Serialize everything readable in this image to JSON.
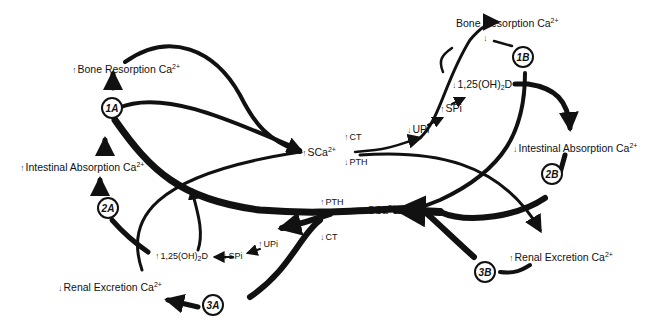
{
  "diagram": {
    "up": "↑",
    "down": "↓",
    "labels": {
      "left_bone_resorption": {
        "dir": "↑",
        "text": "Bone Resorption Ca",
        "sup": "2+"
      },
      "left_intestinal_absorption": {
        "dir": "↑",
        "text": "Intestinal Absorption Ca",
        "sup": "2+"
      },
      "left_renal_excretion": {
        "dir": "↓",
        "text": "Renal Excretion Ca",
        "sup": "2+"
      },
      "right_bone_resorption": {
        "text": "Bone Resorption Ca",
        "sup": "2+",
        "dir_below": "↓"
      },
      "right_intestinal_absorption": {
        "dir": "↓",
        "text": "Intestinal Absorption Ca",
        "sup": "2+"
      },
      "right_renal_excretion": {
        "dir": "↑",
        "text": "Renal Excretion Ca",
        "sup": "2+"
      },
      "upper_sca": {
        "dir": "↑",
        "text": "SCa",
        "sup": "2+"
      },
      "upper_ct": {
        "dir": "↑",
        "text": "CT"
      },
      "upper_pth": {
        "dir": "↓",
        "text": "PTH"
      },
      "upper_upi": {
        "dir": "↓",
        "text": "UPi"
      },
      "upper_spi": {
        "dir": "↑",
        "text": "SPi"
      },
      "upper_vitd": {
        "dir": "↓",
        "text_a": "1,25(OH)",
        "sub": "2",
        "text_b": "D"
      },
      "lower_sca": {
        "dir": "↓",
        "text": "SCa",
        "sup": "2+"
      },
      "lower_pth": {
        "dir": "↑",
        "text": "PTH"
      },
      "lower_ct": {
        "dir": "↓",
        "text": "CT"
      },
      "lower_upi": {
        "dir": "↑",
        "text": "UPi"
      },
      "lower_spi": {
        "dir": "↓",
        "text": "SPi"
      },
      "lower_vitd": {
        "dir": "↑",
        "text_a": "1,25(OH)",
        "sub": "2",
        "text_b": "D"
      }
    },
    "nodes": {
      "n1a": "1A",
      "n2a": "2A",
      "n3a": "3A",
      "n1b": "1B",
      "n2b": "2B",
      "n3b": "3B"
    },
    "colors": {
      "ink": "#111111",
      "background": "#ffffff"
    }
  }
}
